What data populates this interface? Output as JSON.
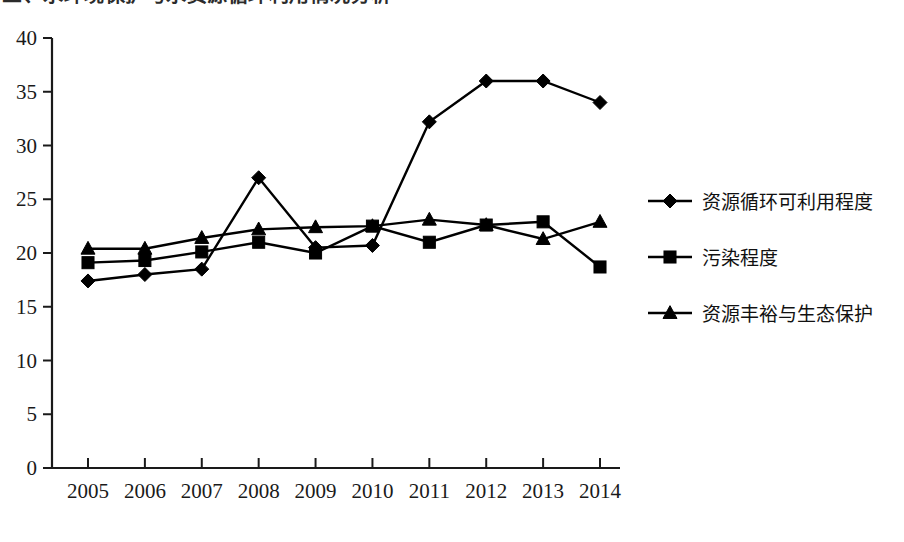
{
  "top_caption": {
    "text": "三、水环境保护与水资源循环利用情况分析"
  },
  "chart_data": {
    "type": "line",
    "title": "",
    "subtitle": "",
    "xlabel": "",
    "ylabel": "",
    "categories": [
      "2005",
      "2006",
      "2007",
      "2008",
      "2009",
      "2010",
      "2011",
      "2012",
      "2013",
      "2014"
    ],
    "ylim": [
      0,
      40
    ],
    "ytick_step": 5,
    "yticks": [
      "0",
      "5",
      "10",
      "15",
      "20",
      "25",
      "30",
      "35",
      "40"
    ],
    "grid": false,
    "legend_position": "right",
    "series": [
      {
        "name": "资源循环可利用程度",
        "marker": "diamond",
        "color": "#000000",
        "values": [
          17.4,
          18.0,
          18.5,
          27.0,
          20.5,
          20.7,
          32.2,
          36.0,
          36.0,
          34.0
        ]
      },
      {
        "name": "污染程度",
        "marker": "square",
        "color": "#000000",
        "values": [
          19.1,
          19.3,
          20.1,
          21.0,
          20.0,
          22.5,
          21.0,
          22.6,
          22.9,
          18.7
        ]
      },
      {
        "name": "资源丰裕与生态保护",
        "marker": "triangle",
        "color": "#000000",
        "values": [
          20.4,
          20.4,
          21.4,
          22.2,
          22.4,
          22.5,
          23.1,
          22.6,
          21.3,
          22.9
        ]
      }
    ]
  },
  "legend": {
    "items": [
      {
        "label": "资源循环可利用程度",
        "marker": "diamond"
      },
      {
        "label": "污染程度",
        "marker": "square"
      },
      {
        "label": "资源丰裕与生态保护",
        "marker": "triangle"
      }
    ]
  }
}
